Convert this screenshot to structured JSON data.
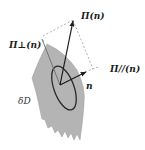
{
  "diagram": {
    "labels": {
      "pi_total": "Π(n)",
      "pi_perp": "Π⊥(n)",
      "pi_parallel": "Π//(n)",
      "normal": "n",
      "boundary": "δD"
    },
    "colors": {
      "surface_fill": "#b4b4b4",
      "surface_edge": "#8a8a8a",
      "vector": "#1a1a1a",
      "dashed": "#9a9a9a",
      "ellipse": "#2a2a2a"
    },
    "elements": [
      {
        "name": "surface-element",
        "shape": "curved-band"
      },
      {
        "name": "area-ellipse",
        "shape": "ellipse"
      },
      {
        "name": "vector-pi",
        "from": [
          60,
          85
        ],
        "to": [
          73,
          20
        ]
      },
      {
        "name": "vector-pi-perp",
        "from": [
          60,
          85
        ],
        "to": [
          41,
          38
        ]
      },
      {
        "name": "vector-normal",
        "from": [
          60,
          85
        ],
        "to": [
          85,
          72
        ]
      },
      {
        "name": "dashed-pi-parallel",
        "from": [
          85,
          72
        ],
        "to": [
          93,
          69
        ]
      }
    ]
  }
}
